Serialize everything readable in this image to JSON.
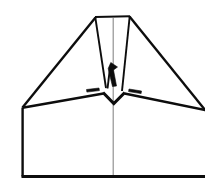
{
  "figure": {
    "title": "Paper airplane line drawing",
    "view": "top-down plan view, nose up",
    "style": "black ink line art on white background",
    "canvas": {
      "width": 205,
      "height": 186,
      "background": "#ffffff"
    },
    "colors": {
      "ink": "#0d0d0d",
      "faint_fold": "#8d8d8d",
      "background": "#ffffff"
    },
    "stroke_widths": {
      "thin": 1.9,
      "medium": 2.4,
      "thick": 3.1,
      "faint": 1.15
    },
    "key_points": {
      "nose_top_left": [
        95,
        17
      ],
      "nose_top_right": [
        130,
        16
      ],
      "left_wing_tip": [
        22,
        108
      ],
      "right_wing_tip": [
        205,
        110
      ],
      "center_notch_bottom": [
        114,
        103
      ],
      "body_bottom_left": [
        22,
        177
      ],
      "body_bottom_right": [
        205,
        177
      ],
      "center_axis_x": 113
    },
    "parts": [
      {
        "name": "nose-top-edge",
        "description": "Flat horizontal blunt nose edge at the top",
        "points": "95,17 130,16"
      },
      {
        "name": "left-wing-leading-edge",
        "description": "Long swept line from nose down-left to the left wing tip",
        "points": "95,17 22,108"
      },
      {
        "name": "right-wing-leading-edge",
        "description": "Long swept line from nose down-right to the right wing tip",
        "points": "130,16 205,110"
      },
      {
        "name": "left-wing-trailing-edge",
        "description": "Line from left wing tip up-right to the central fold junction",
        "points": "22,108 104,93"
      },
      {
        "name": "right-wing-trailing-edge",
        "description": "Line from right wing tip up-left to the central fold junction",
        "points": "205,110 124,93"
      },
      {
        "name": "center-notch",
        "description": "Small V notch under the fuselage where the wings meet",
        "points": "104,93 114,103 124,93"
      },
      {
        "name": "keel-left-edge",
        "description": "Narrow fin edge tapering from nose-left down to the center",
        "points": "95,17 106,90"
      },
      {
        "name": "keel-right-edge",
        "description": "Narrow fin edge tapering from nose-right down to the center",
        "points": "130,16 122,92"
      },
      {
        "name": "body-left-edge",
        "description": "Vertical left edge of the rectangular fuselage body",
        "points": "22,108 22,177"
      },
      {
        "name": "body-bottom-edge",
        "description": "Horizontal bottom edge of the fuselage body",
        "points": "22,177 205,177"
      },
      {
        "name": "center-fold-line",
        "description": "Faint grey vertical center fold crease",
        "points": "113,17 113,177"
      }
    ]
  }
}
